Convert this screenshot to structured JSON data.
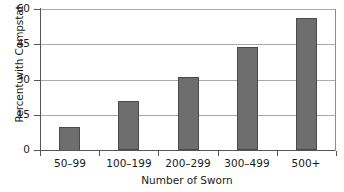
{
  "chart_data": {
    "type": "bar",
    "title": "",
    "xlabel": "Number of Sworn",
    "ylabel": "Percent with Compstat",
    "categories": [
      "50–99",
      "100–199",
      "200–299",
      "300–499",
      "500+"
    ],
    "values": [
      10,
      21,
      31,
      44,
      56
    ],
    "ylim": [
      0,
      60
    ],
    "yticks": [
      0,
      15,
      30,
      45,
      60
    ],
    "ytick_labels": [
      "0",
      "15",
      "30",
      "45",
      "60"
    ],
    "grid": "horizontal",
    "legend": "none",
    "bar_color": "#6e6e6e",
    "bar_edge_color": "#4a4a4a",
    "gridline_color": "#a9a9a9",
    "axis_color": "#555555",
    "background_color": "#ffffff"
  }
}
